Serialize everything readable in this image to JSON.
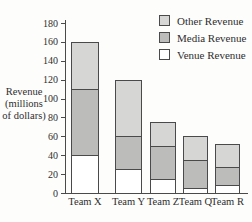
{
  "chart_data": {
    "type": "bar",
    "stacked": true,
    "title": "",
    "xlabel": "",
    "ylabel": "Revenue (millions of dollars)",
    "ylabel_lines": [
      "Revenue",
      "(millions",
      "of dollars)"
    ],
    "categories": [
      "Team X",
      "Team Y",
      "Team Z",
      "Team Q",
      "Team R"
    ],
    "series": [
      {
        "name": "Venue Revenue",
        "color": "#ffffff",
        "values": [
          40,
          25,
          15,
          5,
          8
        ]
      },
      {
        "name": "Media Revenue",
        "color": "#bcbcba",
        "values": [
          70,
          35,
          35,
          30,
          20
        ]
      },
      {
        "name": "Other Revenue",
        "color": "#d6d6d4",
        "values": [
          50,
          60,
          25,
          25,
          24
        ]
      }
    ],
    "totals": [
      160,
      120,
      75,
      60,
      52
    ],
    "ylim": [
      0,
      180
    ],
    "yticks": [
      0,
      20,
      40,
      60,
      80,
      100,
      120,
      140,
      160,
      180
    ],
    "grid": "off",
    "legend_position": "top-right",
    "legend_order": [
      "Other Revenue",
      "Media Revenue",
      "Venue Revenue"
    ]
  },
  "colors": {
    "axis": "#4a4a4a",
    "bar_border": "#4a4a4a",
    "text": "#2e2e2e",
    "background": "#fdfdfc",
    "other_revenue": "#d6d6d4",
    "media_revenue": "#bcbcba",
    "venue_revenue": "#ffffff"
  }
}
